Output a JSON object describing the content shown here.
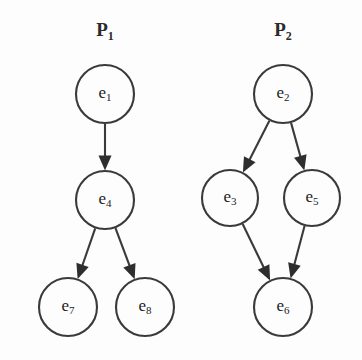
{
  "figure": {
    "background_color": "#fdfdfd",
    "stroke_color": "#3a3a3a",
    "text_color": "#222222",
    "graphs": [
      {
        "id": "P1",
        "title_main": "P",
        "title_sub": "1",
        "title_x": 105,
        "title_y": 32,
        "nodes": [
          {
            "id": "e1",
            "label_main": "e",
            "label_sub": "1",
            "cx": 105,
            "cy": 94,
            "r": 29
          },
          {
            "id": "e4",
            "label_main": "e",
            "label_sub": "4",
            "cx": 105,
            "cy": 200,
            "r": 29
          },
          {
            "id": "e7",
            "label_main": "e",
            "label_sub": "7",
            "cx": 68,
            "cy": 307,
            "r": 29
          },
          {
            "id": "e8",
            "label_main": "e",
            "label_sub": "8",
            "cx": 145,
            "cy": 307,
            "r": 29
          }
        ],
        "edges": [
          {
            "from": "e1",
            "to": "e4"
          },
          {
            "from": "e4",
            "to": "e7"
          },
          {
            "from": "e4",
            "to": "e8"
          }
        ]
      },
      {
        "id": "P2",
        "title_main": "P",
        "title_sub": "2",
        "title_x": 283,
        "title_y": 32,
        "nodes": [
          {
            "id": "e2",
            "label_main": "e",
            "label_sub": "2",
            "cx": 283,
            "cy": 94,
            "r": 29
          },
          {
            "id": "e3",
            "label_main": "e",
            "label_sub": "3",
            "cx": 230,
            "cy": 198,
            "r": 28
          },
          {
            "id": "e5",
            "label_main": "e",
            "label_sub": "5",
            "cx": 312,
            "cy": 198,
            "r": 28
          },
          {
            "id": "e6",
            "label_main": "e",
            "label_sub": "6",
            "cx": 283,
            "cy": 307,
            "r": 29
          }
        ],
        "edges": [
          {
            "from": "e2",
            "to": "e3"
          },
          {
            "from": "e2",
            "to": "e5"
          },
          {
            "from": "e3",
            "to": "e6"
          },
          {
            "from": "e5",
            "to": "e6"
          }
        ]
      }
    ]
  },
  "chart_data": {
    "type": "diagram",
    "title": "",
    "subtype": "directed-acyclic-graph-pair",
    "graphs": [
      {
        "name": "P1",
        "nodes": [
          "e1",
          "e4",
          "e7",
          "e8"
        ],
        "edges": [
          [
            "e1",
            "e4"
          ],
          [
            "e4",
            "e7"
          ],
          [
            "e4",
            "e8"
          ]
        ]
      },
      {
        "name": "P2",
        "nodes": [
          "e2",
          "e3",
          "e5",
          "e6"
        ],
        "edges": [
          [
            "e2",
            "e3"
          ],
          [
            "e2",
            "e5"
          ],
          [
            "e3",
            "e6"
          ],
          [
            "e5",
            "e6"
          ]
        ]
      }
    ]
  }
}
